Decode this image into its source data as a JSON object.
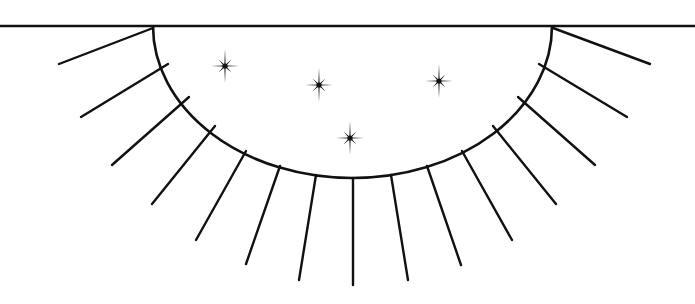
{
  "diagram": {
    "stroke_color": "#111111",
    "background_color": "#ffffff",
    "horizon": {
      "x1": 0,
      "y1": 26,
      "x2": 695,
      "y2": 26
    },
    "half_disc": {
      "cx": 352.5,
      "cy": 26,
      "rx": 199.5,
      "ry": 152
    },
    "rays": [
      {
        "x1": 153,
        "y1": 28,
        "x2": 59,
        "y2": 64
      },
      {
        "x1": 168,
        "y1": 64,
        "x2": 81,
        "y2": 117
      },
      {
        "x1": 189,
        "y1": 97,
        "x2": 112,
        "y2": 165
      },
      {
        "x1": 215,
        "y1": 126,
        "x2": 152,
        "y2": 204
      },
      {
        "x1": 246,
        "y1": 151,
        "x2": 196,
        "y2": 240
      },
      {
        "x1": 280,
        "y1": 166,
        "x2": 246,
        "y2": 264
      },
      {
        "x1": 316,
        "y1": 175,
        "x2": 299,
        "y2": 280
      },
      {
        "x1": 353,
        "y1": 178,
        "x2": 353,
        "y2": 285
      },
      {
        "x1": 391,
        "y1": 175,
        "x2": 408,
        "y2": 280
      },
      {
        "x1": 427,
        "y1": 166,
        "x2": 461,
        "y2": 265
      },
      {
        "x1": 462,
        "y1": 151,
        "x2": 512,
        "y2": 240
      },
      {
        "x1": 493,
        "y1": 126,
        "x2": 556,
        "y2": 204
      },
      {
        "x1": 518,
        "y1": 97,
        "x2": 595,
        "y2": 165
      },
      {
        "x1": 539,
        "y1": 64,
        "x2": 627,
        "y2": 117
      },
      {
        "x1": 553,
        "y1": 28,
        "x2": 650,
        "y2": 64
      }
    ],
    "stars": [
      {
        "cx": 225,
        "cy": 66
      },
      {
        "cx": 319,
        "cy": 85
      },
      {
        "cx": 439,
        "cy": 81
      },
      {
        "cx": 350,
        "cy": 138
      }
    ]
  }
}
